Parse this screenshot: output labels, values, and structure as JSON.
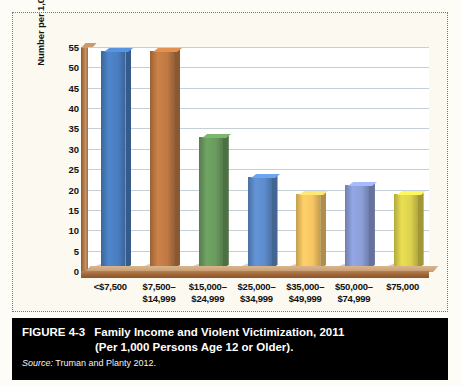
{
  "figure": {
    "number": "FIGURE 4-3",
    "title_line1": "Family Income and Violent Victimization, 2011",
    "title_line2": "(Per 1,000 Persons Age 12 or Older).",
    "source_label": "Source:",
    "source_text": " Truman and Planty 2012."
  },
  "chart_data": {
    "type": "bar",
    "title": "Family Income and Violent Victimization, 2011 (Per 1,000 Persons Age 12 or Older).",
    "xlabel": "",
    "ylabel": "Number per 1,000 Persons",
    "ylim": [
      0,
      55
    ],
    "ytick_step": 5,
    "grid": true,
    "legend": "none",
    "categories": [
      "<$7,500",
      "$7,500–$14,999",
      "$15,000–$24,999",
      "$25,000–$34,999",
      "$35,000–$49,999",
      "$50,000–$74,999",
      "$75,000"
    ],
    "category_lines": [
      [
        "<$7,500",
        ""
      ],
      [
        "$7,500–",
        "$14,999"
      ],
      [
        "$15,000–",
        "$24,999"
      ],
      [
        "$25,000–",
        "$34,999"
      ],
      [
        "$35,000–",
        "$49,999"
      ],
      [
        "$50,000–",
        "$74,999"
      ],
      [
        "$75,000",
        ""
      ]
    ],
    "values": [
      54,
      54,
      33,
      23,
      19,
      21,
      19
    ],
    "colors": [
      "#4a7ec0",
      "#c07a44",
      "#6a9b5e",
      "#5d8ccb",
      "#f5c563",
      "#8c9ed8",
      "#ddd24e"
    ],
    "yticks": [
      0,
      5,
      10,
      15,
      20,
      25,
      30,
      35,
      40,
      45,
      50,
      55
    ],
    "ytick_labels": [
      "0",
      "5",
      "10",
      "15",
      "20",
      "25",
      "30",
      "35",
      "40",
      "45",
      "50",
      "55"
    ]
  }
}
